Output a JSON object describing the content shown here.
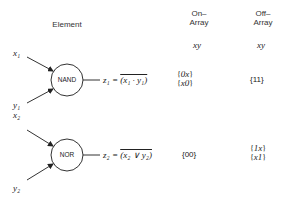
{
  "headers": {
    "element": "Element",
    "on_array": [
      "On–",
      "Array"
    ],
    "off_array": [
      "Off–",
      "Array"
    ],
    "on_vars": "xy",
    "off_vars": "xy"
  },
  "rows": [
    {
      "gate": "NAND",
      "inputs": [
        "x",
        "1",
        "y",
        "1"
      ],
      "input_labels": {
        "top": "x₁",
        "bottom": "y₁"
      },
      "output_lhs": "z₁ = ",
      "output_expr": "(x₁ · y₁)",
      "on_array": [
        "0x",
        "x0"
      ],
      "off_array": [
        "11"
      ]
    },
    {
      "gate": "NOR",
      "input_labels": {
        "top": "x₂",
        "bottom": "y₂"
      },
      "output_lhs": "z₂ = ",
      "output_expr": "(x₂ ∨ y₂)",
      "on_array": [
        "00"
      ],
      "off_array": [
        "1x",
        "x1"
      ]
    }
  ]
}
